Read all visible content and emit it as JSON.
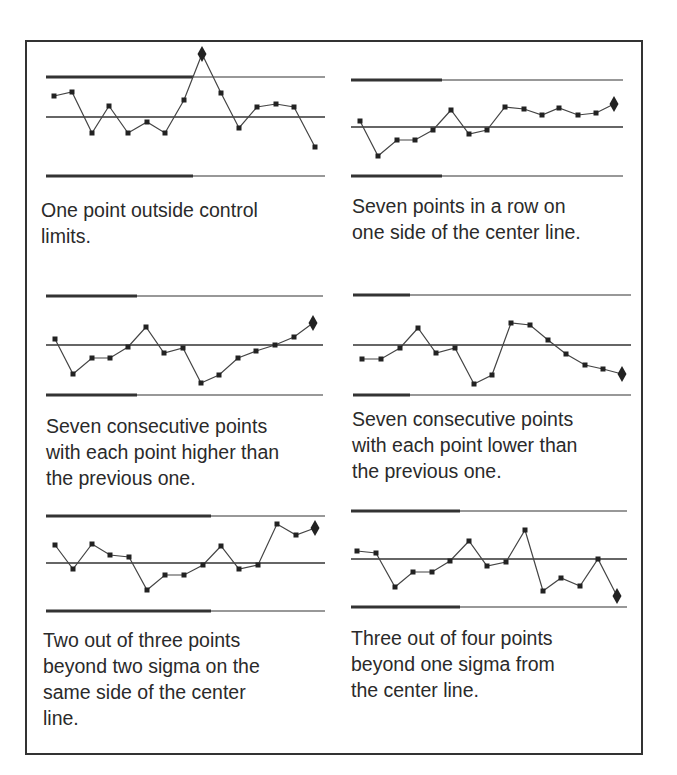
{
  "figure": {
    "captions": [
      [
        "One point outside control",
        "limits."
      ],
      [
        "Seven points in a row on",
        "one side of the center line."
      ],
      [
        "Seven consecutive points",
        "with each point higher than",
        "the previous one."
      ],
      [
        "Seven consecutive points",
        "with each point lower than",
        "the previous one."
      ],
      [
        "Two out of three points",
        "beyond two sigma on the",
        "same side of the center",
        "line."
      ],
      [
        "Three out of four points",
        "beyond one sigma from",
        "the center line."
      ]
    ],
    "colors": {
      "line": "#333333",
      "frame": "#333333",
      "text": "#2a2a2a"
    }
  },
  "chart_data": [
    {
      "type": "line",
      "title": "One point outside control limits.",
      "panel": {
        "x0": 46,
        "x1": 325,
        "thick_end": 193,
        "ucl_y": 77,
        "cl_y": 117,
        "lcl_y": 176
      },
      "points": [
        [
          54,
          96
        ],
        [
          72,
          92
        ],
        [
          92,
          133
        ],
        [
          109,
          106
        ],
        [
          128,
          133
        ],
        [
          147,
          122
        ],
        [
          165,
          133
        ],
        [
          184,
          100
        ],
        [
          202,
          54
        ],
        [
          221,
          93
        ],
        [
          239,
          128
        ],
        [
          257,
          107
        ],
        [
          276,
          104
        ],
        [
          294,
          107
        ],
        [
          315,
          147
        ]
      ],
      "flagged_index": 8,
      "lines": [
        "UCL",
        "Center line",
        "LCL"
      ]
    },
    {
      "type": "line",
      "title": "Seven points in a row on one side of the center line.",
      "panel": {
        "x0": 351,
        "x1": 623,
        "thick_end": 442,
        "ucl_y": 80,
        "cl_y": 127,
        "lcl_y": 176
      },
      "points": [
        [
          360,
          121
        ],
        [
          378,
          156
        ],
        [
          397,
          140
        ],
        [
          415,
          140
        ],
        [
          433,
          130
        ],
        [
          451,
          110
        ],
        [
          469,
          134
        ],
        [
          487,
          130
        ],
        [
          505,
          107
        ],
        [
          524,
          109
        ],
        [
          542,
          115
        ],
        [
          559,
          108
        ],
        [
          578,
          115
        ],
        [
          596,
          113
        ],
        [
          614,
          104
        ]
      ],
      "flagged_index": 14,
      "lines": [
        "UCL",
        "Center line",
        "LCL"
      ]
    },
    {
      "type": "line",
      "title": "Seven consecutive points with each point higher than the previous one.",
      "panel": {
        "x0": 46,
        "x1": 323,
        "thick_end": 137,
        "ucl_y": 296,
        "cl_y": 345,
        "lcl_y": 395
      },
      "points": [
        [
          55,
          339
        ],
        [
          73,
          374
        ],
        [
          92,
          358
        ],
        [
          110,
          358
        ],
        [
          128,
          347
        ],
        [
          146,
          327
        ],
        [
          164,
          353
        ],
        [
          183,
          348
        ],
        [
          201,
          383
        ],
        [
          219,
          375
        ],
        [
          238,
          358
        ],
        [
          256,
          351
        ],
        [
          275,
          345
        ],
        [
          294,
          337
        ],
        [
          313,
          323
        ]
      ],
      "flagged_index": 14,
      "lines": [
        "UCL",
        "Center line",
        "LCL"
      ]
    },
    {
      "type": "line",
      "title": "Seven consecutive points with each point lower than the previous one.",
      "panel": {
        "x0": 353,
        "x1": 631,
        "thick_end": 410,
        "ucl_y": 295,
        "cl_y": 345,
        "lcl_y": 395
      },
      "points": [
        [
          362,
          359
        ],
        [
          381,
          359
        ],
        [
          400,
          348
        ],
        [
          418,
          328
        ],
        [
          436,
          353
        ],
        [
          455,
          348
        ],
        [
          474,
          384
        ],
        [
          492,
          375
        ],
        [
          511,
          323
        ],
        [
          530,
          325
        ],
        [
          548,
          340
        ],
        [
          566,
          354
        ],
        [
          585,
          365
        ],
        [
          603,
          369
        ],
        [
          622,
          374
        ]
      ],
      "flagged_index": 14,
      "lines": [
        "UCL",
        "Center line",
        "LCL"
      ]
    },
    {
      "type": "line",
      "title": "Two out of three points beyond two sigma on the same side of the center line.",
      "panel": {
        "x0": 46,
        "x1": 325,
        "thick_end": 211,
        "ucl_y": 516,
        "cl_y": 563,
        "lcl_y": 611
      },
      "points": [
        [
          55,
          545
        ],
        [
          73,
          569
        ],
        [
          92,
          544
        ],
        [
          110,
          555
        ],
        [
          129,
          557
        ],
        [
          147,
          590
        ],
        [
          165,
          575
        ],
        [
          184,
          575
        ],
        [
          203,
          565
        ],
        [
          221,
          546
        ],
        [
          239,
          569
        ],
        [
          258,
          565
        ],
        [
          277,
          524
        ],
        [
          296,
          535
        ],
        [
          315,
          528
        ]
      ],
      "flagged_index": 14,
      "lines": [
        "UCL",
        "Center line",
        "LCL"
      ]
    },
    {
      "type": "line",
      "title": "Three out of four points beyond one sigma from the center line.",
      "panel": {
        "x0": 351,
        "x1": 627,
        "thick_end": 460,
        "ucl_y": 511,
        "cl_y": 559,
        "lcl_y": 607
      },
      "points": [
        [
          357,
          551
        ],
        [
          376,
          553
        ],
        [
          395,
          587
        ],
        [
          413,
          572
        ],
        [
          432,
          572
        ],
        [
          450,
          561
        ],
        [
          469,
          541
        ],
        [
          487,
          566
        ],
        [
          506,
          562
        ],
        [
          525,
          530
        ],
        [
          543,
          591
        ],
        [
          561,
          578
        ],
        [
          580,
          586
        ],
        [
          598,
          559
        ],
        [
          617,
          596
        ]
      ],
      "flagged_index": 14,
      "lines": [
        "UCL",
        "Center line",
        "LCL"
      ]
    }
  ]
}
